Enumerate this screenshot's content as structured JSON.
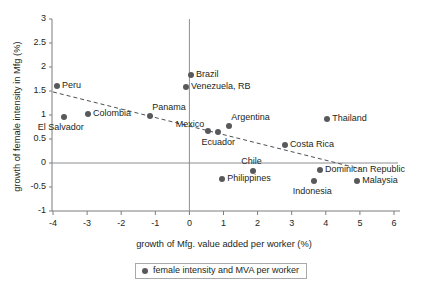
{
  "chart_data": {
    "type": "scatter",
    "title": "",
    "xlabel": "growth of Mfg. value added per worker (%)",
    "ylabel": "growth of female intensity in Mfg (%)",
    "xlim": [
      -4.3,
      6.2
    ],
    "ylim": [
      -1.1,
      3.1
    ],
    "xticks": [
      -4,
      -3,
      -2,
      -1,
      0,
      1,
      2,
      3,
      4,
      5,
      6
    ],
    "xtick_labels": [
      "-4",
      "-3",
      "-2",
      "-1",
      "0",
      "1",
      "2",
      "3",
      "4",
      "5",
      "6"
    ],
    "yticks": [
      -1,
      -0.5,
      0,
      0.5,
      1,
      1.5,
      2,
      2.5,
      3
    ],
    "ytick_labels": [
      "-1",
      "-0.5",
      "0",
      "0.5",
      "1",
      "1.5",
      "2",
      "2.5",
      "3"
    ],
    "grid": false,
    "legend_position": "bottom",
    "legend": [
      "female intensity and MVA per worker"
    ],
    "reference_lines": [
      {
        "name": "x-zero-vertical",
        "orientation": "vertical",
        "value": 0
      },
      {
        "name": "y-zero-horizontal",
        "orientation": "horizontal",
        "value": 0
      }
    ],
    "trendline": {
      "name": "fitted-trend",
      "style": "dashed",
      "x_start": -4.0,
      "y_start": 1.48,
      "x_end": 5.0,
      "y_end": -0.12
    },
    "series": [
      {
        "name": "female intensity and MVA per worker",
        "marker_color": "#58595b",
        "points": [
          {
            "label": "Peru",
            "x": -3.88,
            "y": 1.6,
            "label_pos": "right"
          },
          {
            "label": "El Salvador",
            "x": -3.68,
            "y": 0.96,
            "label_pos": "below"
          },
          {
            "label": "Colombia",
            "x": -2.97,
            "y": 1.02,
            "label_pos": "right"
          },
          {
            "label": "Panama",
            "x": -1.15,
            "y": 0.98,
            "label_pos": "above-right"
          },
          {
            "label": "Brazil",
            "x": 0.05,
            "y": 1.83,
            "label_pos": "right"
          },
          {
            "label": "Venezuela, RB",
            "x": -0.1,
            "y": 1.58,
            "label_pos": "right"
          },
          {
            "label": "Mexico",
            "x": 0.55,
            "y": 0.67,
            "label_pos": "above-left"
          },
          {
            "label": "Ecuador",
            "x": 0.84,
            "y": 0.65,
            "label_pos": "below"
          },
          {
            "label": "Argentina",
            "x": 1.17,
            "y": 0.77,
            "label_pos": "above-right"
          },
          {
            "label": "Costa Rica",
            "x": 2.8,
            "y": 0.38,
            "label_pos": "right"
          },
          {
            "label": "Thailand",
            "x": 4.04,
            "y": 0.92,
            "label_pos": "right"
          },
          {
            "label": "Chile",
            "x": 1.87,
            "y": -0.17,
            "label_pos": "above"
          },
          {
            "label": "Philippines",
            "x": 0.96,
            "y": -0.33,
            "label_pos": "right"
          },
          {
            "label": "Dominican Republic",
            "x": 3.83,
            "y": -0.15,
            "label_pos": "right"
          },
          {
            "label": "Indonesia",
            "x": 3.66,
            "y": -0.38,
            "label_pos": "below"
          },
          {
            "label": "Malaysia",
            "x": 4.92,
            "y": -0.38,
            "label_pos": "right"
          }
        ]
      }
    ]
  },
  "legend": {
    "entry_label": "female intensity and MVA per worker"
  },
  "caption": {
    "partial_text": ""
  }
}
